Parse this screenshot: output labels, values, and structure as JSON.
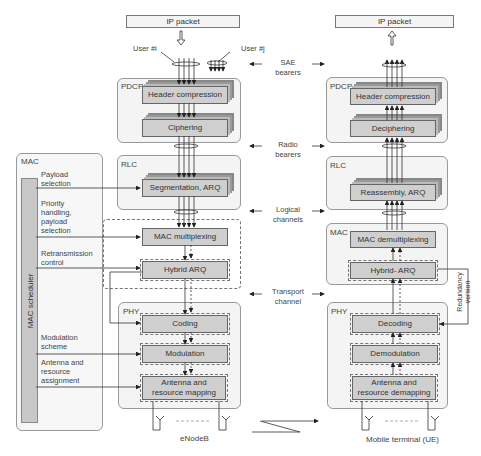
{
  "enodeb": {
    "ip_packet": "IP packet",
    "user_left": "User #i",
    "user_right": "User #j",
    "pdcp": {
      "label": "PDCP",
      "blocks": [
        "Header compression",
        "Ciphering"
      ]
    },
    "rlc": {
      "label": "RLC",
      "blocks": [
        "Segmentation, ARQ"
      ]
    },
    "mac": {
      "label": "MAC",
      "blocks": [
        "MAC multiplexing",
        "Hybrid ARQ"
      ]
    },
    "phy": {
      "label": "PHY",
      "blocks": [
        "Coding",
        "Modulation",
        "Antenna and resource mapping"
      ]
    },
    "caption": "eNodeB"
  },
  "scheduler": {
    "panel_label": "MAC",
    "bar_label": "MAC scheduler",
    "controls": [
      "Payload selection",
      "Priority handling, payload selection",
      "Retransmission control",
      "Modulation scheme",
      "Antenna and resource assignment"
    ]
  },
  "middle": {
    "sae_bearers": "SAE bearers",
    "radio_bearers": "Radio bearers",
    "logical_channels": "Logical channels",
    "transport_channel": "Transport channel"
  },
  "ue": {
    "ip_packet": "IP packet",
    "pdcp": {
      "label": "PDCP",
      "blocks": [
        "Header compression",
        "Deciphering"
      ]
    },
    "rlc": {
      "label": "RLC",
      "blocks": [
        "Reassembly, ARQ"
      ]
    },
    "mac": {
      "label": "MAC",
      "blocks": [
        "MAC demultiplexing",
        "Hybrid- ARQ"
      ]
    },
    "phy": {
      "label": "PHY",
      "blocks": [
        "Decoding",
        "Demodulation",
        "Antenna and resource demapping"
      ]
    },
    "redundancy_version": "Redundancy version",
    "caption": "Mobile terminal (UE)"
  }
}
